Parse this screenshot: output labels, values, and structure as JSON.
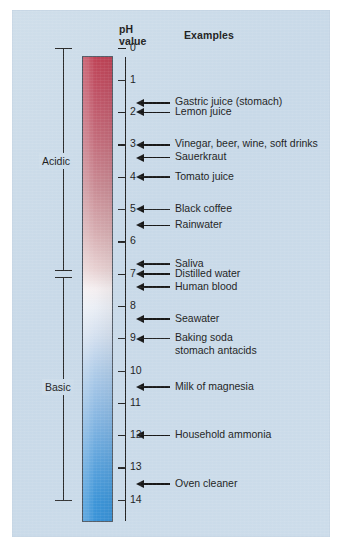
{
  "figure": {
    "background_color": "#cbdce9",
    "headers": {
      "ph_value": "pH\nvalue",
      "examples": "Examples"
    },
    "brackets": [
      {
        "name": "acidic",
        "label": "Acidic",
        "from_ph": 0,
        "to_ph": 7
      },
      {
        "name": "basic",
        "label": "Basic",
        "from_ph": 7,
        "to_ph": 14
      }
    ],
    "scale": {
      "min": 0,
      "max": 14,
      "tick_labels": [
        "0",
        "1",
        "2",
        "3",
        "4",
        "5",
        "6",
        "7",
        "8",
        "9",
        "10",
        "11",
        "12",
        "13",
        "14"
      ],
      "gradient": {
        "acid_color": "#bf4356",
        "neutral_color": "#f4eef0",
        "base_color": "#3a93d8"
      }
    },
    "examples": [
      {
        "label": "Gastric juice (stomach)",
        "ph": 1.7
      },
      {
        "label": "Lemon juice",
        "ph": 2.0
      },
      {
        "label": "Vinegar, beer, wine, soft drinks",
        "ph": 3.0
      },
      {
        "label": "Sauerkraut",
        "ph": 3.4
      },
      {
        "label": "Tomato juice",
        "ph": 4.0
      },
      {
        "label": "Black coffee",
        "ph": 5.0
      },
      {
        "label": "Rainwater",
        "ph": 5.5
      },
      {
        "label": "Saliva",
        "ph": 6.7
      },
      {
        "label": "Distilled water",
        "ph": 7.0
      },
      {
        "label": "Human blood",
        "ph": 7.4
      },
      {
        "label": "Seawater",
        "ph": 8.4
      },
      {
        "label": "Baking soda\nstomach antacids",
        "ph": 9.0
      },
      {
        "label": "Milk of magnesia",
        "ph": 10.5
      },
      {
        "label": "Household ammonia",
        "ph": 12.0
      },
      {
        "label": "Oven cleaner",
        "ph": 13.5
      }
    ]
  }
}
